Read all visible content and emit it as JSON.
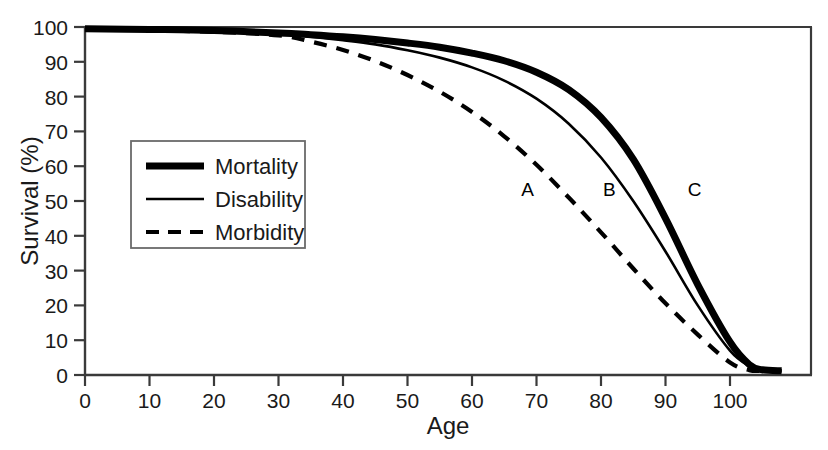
{
  "chart_data": {
    "type": "line",
    "title": "",
    "xlabel": "Age",
    "ylabel": "Survival (%)",
    "xlim": [
      0,
      108
    ],
    "ylim": [
      0,
      100
    ],
    "grid": false,
    "legend_position": "inner-left",
    "xticks": [
      "0",
      "10",
      "20",
      "30",
      "40",
      "50",
      "60",
      "70",
      "80",
      "90",
      "100"
    ],
    "xtick_values": [
      0,
      10,
      20,
      30,
      40,
      50,
      60,
      70,
      80,
      90,
      100
    ],
    "yticks": [
      "0",
      "10",
      "20",
      "30",
      "40",
      "50",
      "60",
      "70",
      "80",
      "90",
      "100"
    ],
    "ytick_values": [
      0,
      10,
      20,
      30,
      40,
      50,
      60,
      70,
      80,
      90,
      100
    ],
    "x": [
      0,
      10,
      20,
      30,
      35,
      40,
      45,
      50,
      55,
      60,
      65,
      70,
      75,
      80,
      85,
      90,
      95,
      100,
      103,
      105,
      108
    ],
    "series": [
      {
        "name": "Mortality",
        "label_annotation": "C",
        "style": "thick-solid",
        "linewidth": 7,
        "dash": "none",
        "color": "#000000",
        "values": [
          99.5,
          99.3,
          99.0,
          98.3,
          97.8,
          97.2,
          96.4,
          95.4,
          94.2,
          92.5,
          90.3,
          87.0,
          82.0,
          74.0,
          62.0,
          45.0,
          26.0,
          9.5,
          3.0,
          1.5,
          1.2
        ]
      },
      {
        "name": "Disability",
        "label_annotation": "B",
        "style": "thin-solid",
        "linewidth": 2.6,
        "dash": "none",
        "color": "#000000",
        "values": [
          99.5,
          99.2,
          98.8,
          98.0,
          97.2,
          96.2,
          95.0,
          93.3,
          91.2,
          88.4,
          84.6,
          79.4,
          72.2,
          62.5,
          50.0,
          35.5,
          20.0,
          7.0,
          2.6,
          1.4,
          1.2
        ]
      },
      {
        "name": "Morbidity",
        "label_annotation": "A",
        "style": "dashed",
        "linewidth": 4.2,
        "dash": "13,10",
        "color": "#000000",
        "values": [
          99.5,
          99.1,
          98.6,
          97.6,
          95.8,
          93.4,
          90.2,
          86.2,
          81.4,
          75.6,
          68.6,
          60.4,
          51.0,
          41.0,
          30.6,
          20.6,
          11.6,
          3.6,
          1.4,
          1.2,
          1.1
        ]
      }
    ],
    "annotations": [
      {
        "text": "A",
        "x": 68.6,
        "y": 51.5,
        "series": "Morbidity"
      },
      {
        "text": "B",
        "x": 81.3,
        "y": 51.5,
        "series": "Disability"
      },
      {
        "text": "C",
        "x": 94.5,
        "y": 51.5,
        "series": "Mortality"
      }
    ]
  },
  "legend": {
    "entries": [
      {
        "label": "Mortality",
        "style": "thick-solid"
      },
      {
        "label": "Disability",
        "style": "thin-solid"
      },
      {
        "label": "Morbidity",
        "style": "dashed"
      }
    ]
  },
  "colors": {
    "ink": "#000000",
    "axis": "#3a3a3a",
    "background": "#ffffff"
  }
}
